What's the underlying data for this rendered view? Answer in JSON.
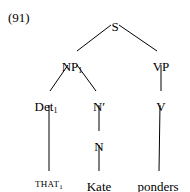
{
  "figure": {
    "example_number": "(91)",
    "type": "syntax-tree",
    "line_color": "#000000",
    "text_color": "#000000",
    "background_color": "#ffffff"
  },
  "nodes": {
    "s": {
      "label": "S",
      "x": 115,
      "y": 20
    },
    "np": {
      "label": "NP",
      "subscript": "1",
      "x": 72,
      "y": 60
    },
    "vp": {
      "label": "VP",
      "subscript": "",
      "x": 161,
      "y": 60
    },
    "det": {
      "label": "Det",
      "subscript": "1",
      "x": 46,
      "y": 100
    },
    "nbar": {
      "label": "N′",
      "subscript": "",
      "x": 99,
      "y": 100
    },
    "v": {
      "label": "V",
      "subscript": "",
      "x": 161,
      "y": 100
    },
    "n": {
      "label": "N",
      "subscript": "",
      "x": 99,
      "y": 140
    },
    "that": {
      "label": "THAT",
      "subscript": "1",
      "x": 49,
      "y": 180
    },
    "kate": {
      "label": "Kate",
      "subscript": "",
      "x": 99,
      "y": 180
    },
    "ponders": {
      "label": "ponders",
      "subscript": "",
      "x": 158,
      "y": 180
    }
  },
  "edges": [
    {
      "name": "s-to-np",
      "x1": 111,
      "y1": 25,
      "x2": 77,
      "y2": 51
    },
    {
      "name": "s-to-vp",
      "x1": 119,
      "y1": 25,
      "x2": 157,
      "y2": 51
    },
    {
      "name": "np-to-det",
      "x1": 68,
      "y1": 65,
      "x2": 50,
      "y2": 91
    },
    {
      "name": "np-to-nbar",
      "x1": 77,
      "y1": 65,
      "x2": 96,
      "y2": 91
    },
    {
      "name": "vp-to-v",
      "x1": 161,
      "y1": 65,
      "x2": 161,
      "y2": 91
    },
    {
      "name": "nbar-to-n",
      "x1": 99,
      "y1": 105,
      "x2": 99,
      "y2": 131
    },
    {
      "name": "n-to-kate",
      "x1": 99,
      "y1": 145,
      "x2": 99,
      "y2": 171
    },
    {
      "name": "det-to-that",
      "x1": 49,
      "y1": 105,
      "x2": 49,
      "y2": 171
    },
    {
      "name": "v-to-ponders",
      "x1": 160,
      "y1": 105,
      "x2": 159,
      "y2": 171
    }
  ]
}
